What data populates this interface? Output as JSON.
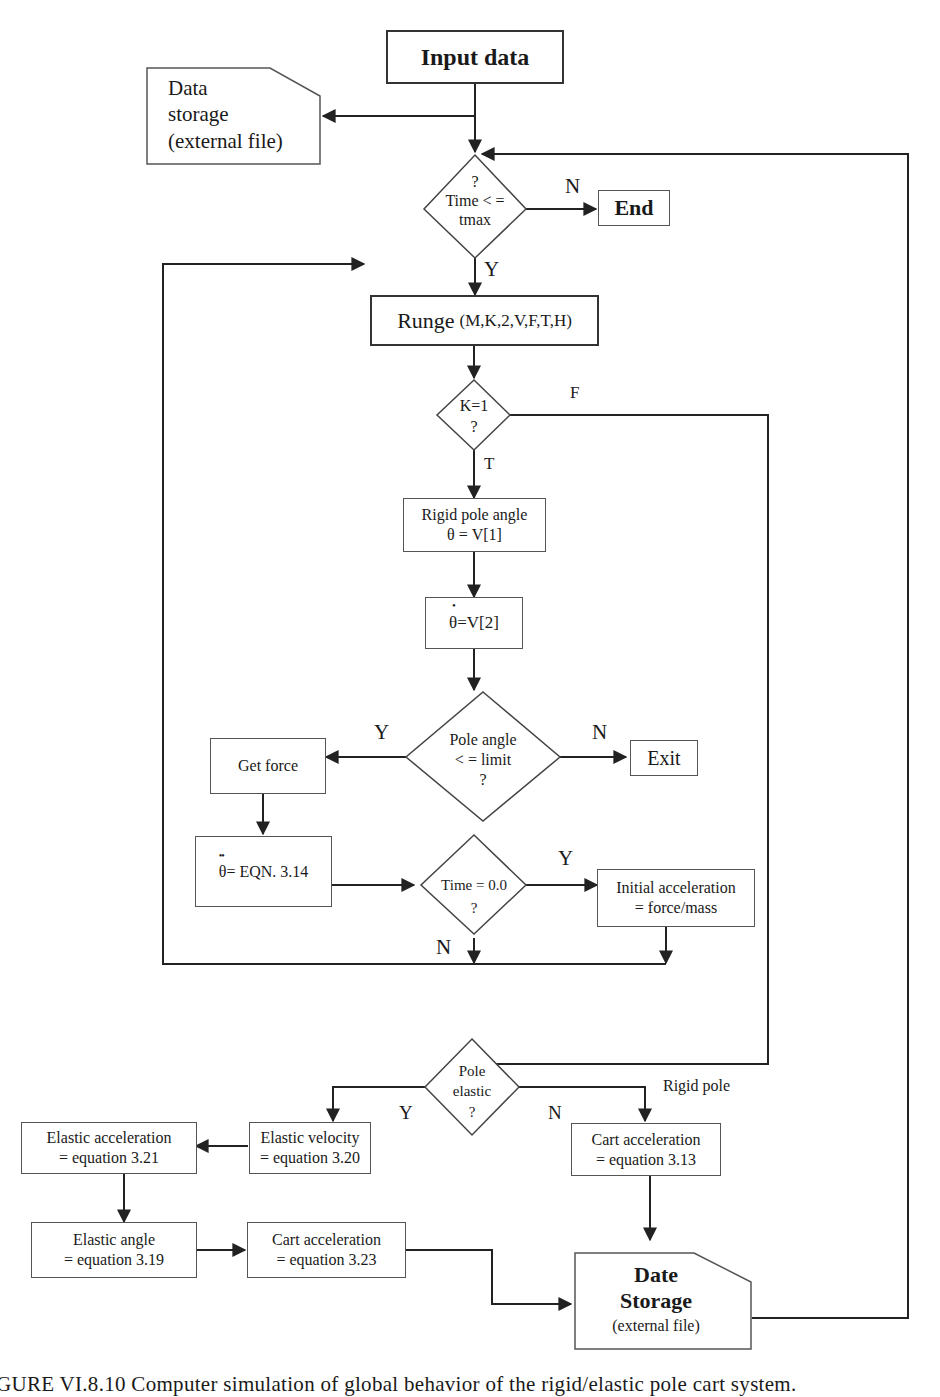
{
  "flowchart": {
    "input": {
      "label": "Input data"
    },
    "data_storage_top": {
      "line1": "Data",
      "line2": "storage",
      "line3": "(external file)"
    },
    "time_decision": {
      "line1": "?",
      "line2": "Time < =",
      "line3": "tmax",
      "yes": "Y",
      "no": "N"
    },
    "end": {
      "label": "End"
    },
    "runge": {
      "name": "Runge",
      "args": "(M,K,2,V,F,T,H)"
    },
    "k_decision": {
      "line1": "K=1",
      "line2": "?",
      "true_label": "T",
      "false_label": "F"
    },
    "rigid_angle": {
      "line1": "Rigid pole angle",
      "line2": "θ = V[1]"
    },
    "theta_dot": {
      "symbol": "θ",
      "dot": "•",
      "rest": " =V[2]"
    },
    "pole_limit_decision": {
      "line1": "Pole angle",
      "line2": "< = limit",
      "line3": "?",
      "yes": "Y",
      "no": "N"
    },
    "exit": {
      "label": "Exit"
    },
    "get_force": {
      "label": "Get force"
    },
    "theta_ddot": {
      "symbol": "θ",
      "dots": "••",
      "rest": " = EQN. 3.14"
    },
    "time_zero_decision": {
      "line1": "Time = 0.0",
      "line2": "?",
      "yes": "Y",
      "no": "N"
    },
    "initial_accel": {
      "line1": "Initial acceleration",
      "line2": "= force/mass"
    },
    "pole_elastic_decision": {
      "line1": "Pole",
      "line2": "elastic",
      "line3": "?",
      "yes": "Y",
      "no": "N",
      "rigid_note": "Rigid pole"
    },
    "elastic_velocity": {
      "line1": "Elastic velocity",
      "line2": "= equation 3.20"
    },
    "elastic_accel": {
      "line1": "Elastic acceleration",
      "line2": "= equation 3.21"
    },
    "elastic_angle": {
      "line1": "Elastic angle",
      "line2": "= equation 3.19"
    },
    "cart_accel_323": {
      "line1": "Cart acceleration",
      "line2": "= equation 3.23"
    },
    "cart_accel_313": {
      "line1": "Cart acceleration",
      "line2": "= equation 3.13"
    },
    "date_storage_bottom": {
      "line1": "Date",
      "line2": "Storage",
      "line3": "(external file)"
    }
  },
  "caption": "GURE VI.8.10    Computer simulation of global behavior of the rigid/elastic pole cart system."
}
